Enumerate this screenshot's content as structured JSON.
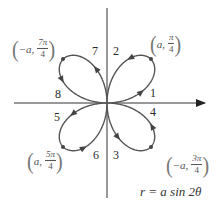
{
  "diagram": {
    "title_equation": "r = a sin 2θ",
    "origin": [
      107,
      103
    ],
    "petal_radius_px": 62,
    "axes": {
      "horizontal": {
        "x1": 14,
        "x2": 205,
        "y": 103,
        "arrow": "right"
      },
      "vertical": {
        "x": 107,
        "y1": 8,
        "y2": 198
      }
    },
    "colors": {
      "curve": "#555555",
      "axis": "#333333",
      "label": "#2a2a2a"
    },
    "step_labels": [
      {
        "text": "1",
        "x": 150,
        "y": 87
      },
      {
        "text": "2",
        "x": 113,
        "y": 45
      },
      {
        "text": "3",
        "x": 113,
        "y": 149
      },
      {
        "text": "4",
        "x": 150,
        "y": 106
      },
      {
        "text": "5",
        "x": 54,
        "y": 111
      },
      {
        "text": "6",
        "x": 93,
        "y": 149
      },
      {
        "text": "7",
        "x": 92,
        "y": 45
      },
      {
        "text": "8",
        "x": 55,
        "y": 88
      }
    ],
    "point_labels": [
      {
        "sign": "",
        "r": "a",
        "num": "π",
        "den": "4",
        "x": 150,
        "y": 33,
        "text": "(a, π/4)"
      },
      {
        "sign": "−",
        "r": "a",
        "num": "3π",
        "den": "4",
        "x": 166,
        "y": 154,
        "text": "(−a, 3π/4)"
      },
      {
        "sign": "",
        "r": "a",
        "num": "5π",
        "den": "4",
        "x": 27,
        "y": 150,
        "text": "(a, 5π/4)"
      },
      {
        "sign": "−",
        "r": "a",
        "num": "7π",
        "den": "4",
        "x": 12,
        "y": 38,
        "text": "(−a, 7π/4)"
      }
    ],
    "tip_points": [
      [
        151,
        59
      ],
      [
        151,
        147
      ],
      [
        63,
        147
      ],
      [
        63,
        59
      ]
    ],
    "equation_label": {
      "text": "r = a sin 2θ",
      "x": 140,
      "y": 186
    }
  }
}
